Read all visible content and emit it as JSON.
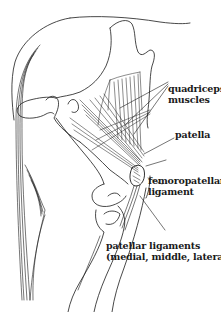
{
  "diagram": {
    "labels": {
      "quadriceps": {
        "line1": "quadriceps",
        "line2": "muscles"
      },
      "patella": {
        "line1": "patella"
      },
      "femoropatellar": {
        "line1": "femoropatellar",
        "line2": "ligament"
      },
      "patellar_ligaments": {
        "line1": "patellar ligaments",
        "line2": "(medial, middle, lateral)"
      }
    },
    "colors": {
      "ink": "#1a1a1a",
      "background": "#ffffff"
    }
  }
}
